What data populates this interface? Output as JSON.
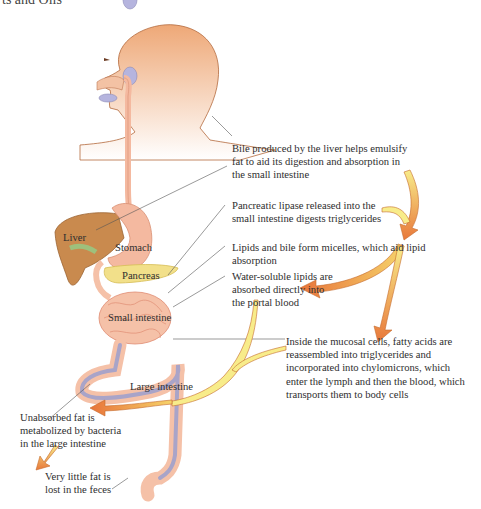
{
  "header": {
    "cut_title": "ts and Oils"
  },
  "organs": {
    "liver": "Liver",
    "stomach": "Stomach",
    "pancreas": "Pancreas",
    "small_intestine": "Small intestine",
    "large_intestine": "Large intestine"
  },
  "notes": {
    "bile": [
      "Bile produced by the liver helps emulsify",
      "fat to aid its digestion and absorption in",
      "the small intestine"
    ],
    "lipase": [
      "Pancreatic lipase released into the",
      "small intestine digests triglycerides"
    ],
    "micelles": [
      "Lipids and bile form micelles, which aid lipid",
      "absorption"
    ],
    "water_soluble": [
      "Water-soluble lipids are",
      "absorbed directly into",
      "the portal blood"
    ],
    "mucosal": [
      "Inside the mucosal cells, fatty acids are",
      "reassembled into triglycerides and",
      "incorporated into chylomicrons, which",
      "enter the lymph and then the blood, which",
      "transports them to body cells"
    ],
    "unabsorbed": [
      "Unabsorbed fat is",
      "metabolized by bacteria",
      "in the large intestine"
    ],
    "feces": [
      "Very little fat is",
      "lost in the feces"
    ]
  },
  "colors": {
    "skin": "#eea877",
    "skin_outline": "#b46a3c",
    "liver": "#c98a4e",
    "stomach": "#f4b9a0",
    "pancreas": "#f2e08a",
    "intestine": "#f5c1a8",
    "large_intestine_inner": "#a9a4c8",
    "arrow_yellow": "#f6e27a",
    "arrow_orange": "#e9793a"
  }
}
